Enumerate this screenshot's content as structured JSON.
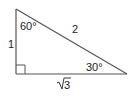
{
  "diagram": {
    "type": "right-triangle",
    "vertices": {
      "top": [
        16,
        9
      ],
      "right_angle": [
        16,
        74
      ],
      "right": [
        127,
        74
      ]
    },
    "angles": {
      "top": "60°",
      "right": "30°",
      "right_angle_marker": true
    },
    "sides": {
      "vertical_leg": "1",
      "hypotenuse": "2",
      "horizontal_leg_radicand": "3",
      "horizontal_leg": "√3"
    },
    "colors": {
      "stroke": "#555555",
      "text": "#222222",
      "background": "#ffffff"
    }
  }
}
